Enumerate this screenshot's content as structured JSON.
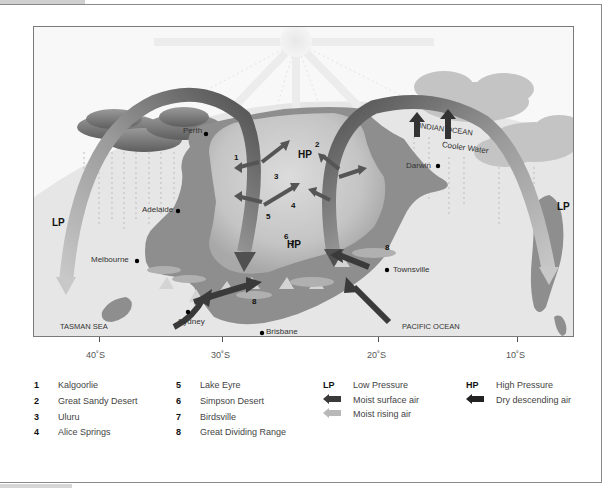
{
  "map": {
    "places": {
      "perth": "Perth",
      "adelaide": "Adelaide",
      "melbourne": "Melbourne",
      "sydney": "Sydney",
      "brisbane": "Brisbane",
      "townsville": "Townsville",
      "darwin": "Darwin"
    },
    "seas": {
      "tasman": "TASMAN SEA",
      "pacific": "PACIFIC OCEAN",
      "indian": "INDIAN OCEAN",
      "cooler_water": "Cooler Water"
    },
    "pressure_labels": {
      "lp_left": "LP",
      "lp_right": "LP",
      "hp_top": "HP",
      "hp_center": "HP"
    },
    "numbers": [
      "1",
      "2",
      "3",
      "4",
      "5",
      "6",
      "7",
      "8",
      "8",
      "8"
    ]
  },
  "axis": {
    "ticks": [
      "40˚S",
      "30˚S",
      "20˚S",
      "10˚S"
    ]
  },
  "legend": {
    "places": [
      {
        "num": "1",
        "name": "Kalgoorlie"
      },
      {
        "num": "2",
        "name": "Great Sandy Desert"
      },
      {
        "num": "3",
        "name": "Uluru"
      },
      {
        "num": "4",
        "name": "Alice Springs"
      },
      {
        "num": "5",
        "name": "Lake Eyre"
      },
      {
        "num": "6",
        "name": "Simpson Desert"
      },
      {
        "num": "7",
        "name": "Birdsville"
      },
      {
        "num": "8",
        "name": "Great Dividing Range"
      }
    ],
    "symbols": {
      "lp_key": "LP",
      "lp_label": "Low Pressure",
      "hp_key": "HP",
      "hp_label": "High Pressure",
      "moist_surface": "Moist surface air",
      "moist_rising": "Moist rising air",
      "dry_descending": "Dry descending air"
    },
    "colors": {
      "moist_surface_arrow": "#3a3a3a",
      "moist_rising_arrow": "#b8b8b8",
      "dry_descending_arrow": "#222222",
      "land": "#8e8e8e",
      "interior": "#c8c8c8"
    }
  }
}
